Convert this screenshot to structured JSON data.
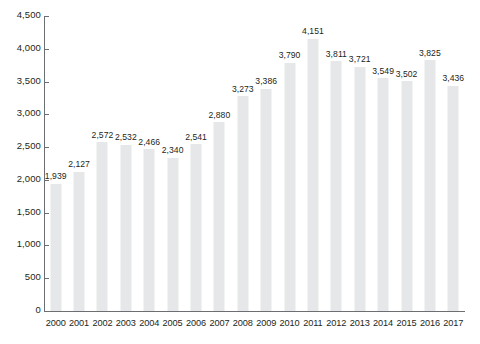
{
  "chart_data": {
    "type": "bar",
    "title": "",
    "subtitle": "",
    "xlabel": "",
    "ylabel": "",
    "legend": [],
    "grid": false,
    "ylim": [
      0,
      4500
    ],
    "ytick_step": 500,
    "ytick_labels": [
      "0",
      "500",
      "1,000",
      "1,500",
      "2,000",
      "2,500",
      "3,000",
      "3,500",
      "4,000",
      "4,500"
    ],
    "ytick_values": [
      0,
      500,
      1000,
      1500,
      2000,
      2500,
      3000,
      3500,
      4000,
      4500
    ],
    "categories": [
      "2000",
      "2001",
      "2002",
      "2003",
      "2004",
      "2005",
      "2006",
      "2007",
      "2008",
      "2009",
      "2010",
      "2011",
      "2012",
      "2013",
      "2014",
      "2015",
      "2016",
      "2017"
    ],
    "values": [
      1939,
      2127,
      2572,
      2532,
      2466,
      2340,
      2541,
      2880,
      3273,
      3386,
      3790,
      4151,
      3811,
      3721,
      3549,
      3502,
      3825,
      3436
    ],
    "value_labels": [
      "1,939",
      "2,127",
      "2,572",
      "2,532",
      "2,466",
      "2,340",
      "2,541",
      "2,880",
      "3,273",
      "3,386",
      "3,790",
      "4,151",
      "3,811",
      "3,721",
      "3,549",
      "3,502",
      "3,825",
      "3,436"
    ],
    "colors": {
      "bar": "#e6e7e8",
      "axis": "#6d6e71",
      "text": "#231f20",
      "background": "#ffffff"
    }
  }
}
